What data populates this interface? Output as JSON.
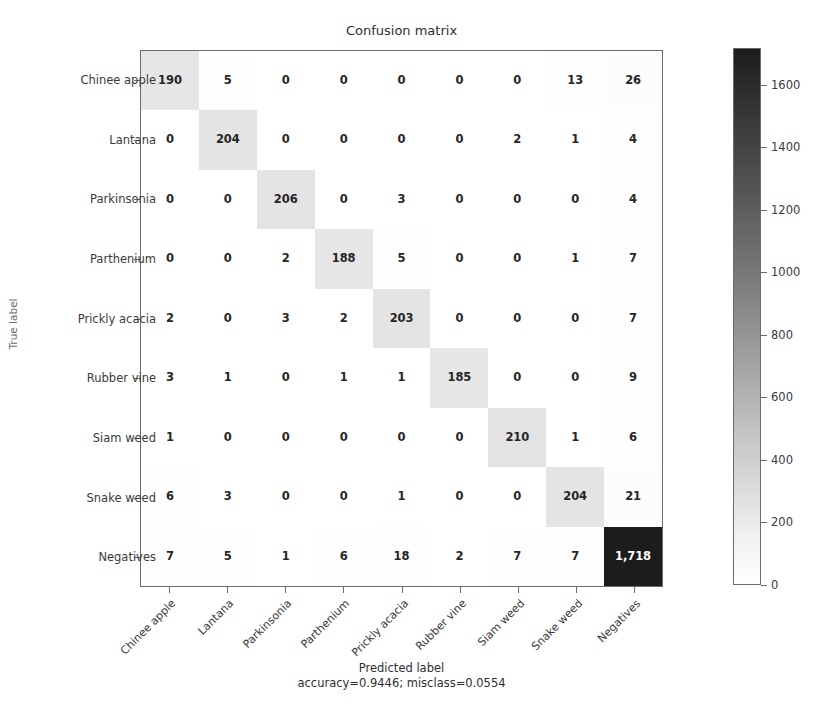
{
  "chart_data": {
    "type": "heatmap",
    "subtype": "confusion-matrix",
    "title": "Confusion matrix",
    "xlabel": "Predicted label",
    "xsublabel": "accuracy=0.9446; misclass=0.0554",
    "ylabel": "True label",
    "accuracy": "0.9446",
    "misclass": "0.0554",
    "categories": [
      "Chinee apple",
      "Lantana",
      "Parkinsonia",
      "Parthenium",
      "Prickly acacia",
      "Rubber vine",
      "Siam weed",
      "Snake weed",
      "Negatives"
    ],
    "x_tick_labels": [
      "Chinee apple",
      "Lantana",
      "Parkinsonia",
      "Parthenium",
      "Prickly acacia",
      "Rubber vine",
      "Siam weed",
      "Snake weed",
      "Negatives"
    ],
    "y_tick_labels": [
      "Chinee apple",
      "Lantana",
      "Parkinsonia",
      "Parthenium",
      "Prickly acacia",
      "Rubber vine",
      "Siam weed",
      "Snake weed",
      "Negatives"
    ],
    "matrix": [
      [
        190,
        5,
        0,
        0,
        0,
        0,
        0,
        13,
        26
      ],
      [
        0,
        204,
        0,
        0,
        0,
        0,
        2,
        1,
        4
      ],
      [
        0,
        0,
        206,
        0,
        3,
        0,
        0,
        0,
        4
      ],
      [
        0,
        0,
        2,
        188,
        5,
        0,
        0,
        1,
        7
      ],
      [
        2,
        0,
        3,
        2,
        203,
        0,
        0,
        0,
        7
      ],
      [
        3,
        1,
        0,
        1,
        1,
        185,
        0,
        0,
        9
      ],
      [
        1,
        0,
        0,
        0,
        0,
        0,
        210,
        1,
        6
      ],
      [
        6,
        3,
        0,
        0,
        1,
        0,
        0,
        204,
        21
      ],
      [
        7,
        5,
        1,
        6,
        18,
        2,
        7,
        7,
        1718
      ]
    ],
    "cell_labels": [
      [
        "190",
        "5",
        "0",
        "0",
        "0",
        "0",
        "0",
        "13",
        "26"
      ],
      [
        "0",
        "204",
        "0",
        "0",
        "0",
        "0",
        "2",
        "1",
        "4"
      ],
      [
        "0",
        "0",
        "206",
        "0",
        "3",
        "0",
        "0",
        "0",
        "4"
      ],
      [
        "0",
        "0",
        "2",
        "188",
        "5",
        "0",
        "0",
        "1",
        "7"
      ],
      [
        "2",
        "0",
        "3",
        "2",
        "203",
        "0",
        "0",
        "0",
        "7"
      ],
      [
        "3",
        "1",
        "0",
        "1",
        "1",
        "185",
        "0",
        "0",
        "9"
      ],
      [
        "1",
        "0",
        "0",
        "0",
        "0",
        "0",
        "210",
        "1",
        "6"
      ],
      [
        "6",
        "3",
        "0",
        "0",
        "1",
        "0",
        "0",
        "204",
        "21"
      ],
      [
        "7",
        "5",
        "1",
        "6",
        "18",
        "2",
        "7",
        "7",
        "1,718"
      ]
    ],
    "colorbar": {
      "ticks": [
        0,
        200,
        400,
        600,
        800,
        1000,
        1200,
        1400,
        1600
      ],
      "tick_labels": [
        "0",
        "200",
        "400",
        "600",
        "800",
        "1000",
        "1200",
        "1400",
        "1600"
      ],
      "vmin": 0,
      "vmax": 1718,
      "colormap": "Greys",
      "position": "right",
      "orientation": "vertical"
    },
    "grid": false,
    "colors": {
      "cmap_low": "#ffffff",
      "cmap_high": "#1c1c1c",
      "text_dark": "#262626",
      "text_light": "#ffffff",
      "axis": "#6b6b6b",
      "background": "#ffffff"
    }
  }
}
